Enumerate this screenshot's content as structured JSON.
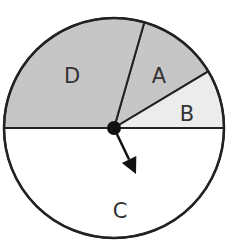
{
  "diagram": {
    "type": "spinner",
    "center": [
      114,
      128
    ],
    "radius": 110,
    "sections": [
      {
        "label": "A",
        "start_deg": 31,
        "end_deg": 74,
        "fill": "#c6c6c6",
        "label_pos": [
          159,
          83
        ]
      },
      {
        "label": "B",
        "start_deg": 0,
        "end_deg": 31,
        "fill": "#ececec",
        "label_pos": [
          187,
          121
        ]
      },
      {
        "label": "C",
        "start_deg": 180,
        "end_deg": 360,
        "fill": "#ffffff",
        "label_pos": [
          120,
          218
        ]
      },
      {
        "label": "D",
        "start_deg": 74,
        "end_deg": 180,
        "fill": "#c6c6c6",
        "label_pos": [
          72,
          83
        ]
      }
    ],
    "arrow": {
      "from": [
        114,
        128
      ],
      "to": [
        136,
        174
      ],
      "color": "#111111"
    },
    "outline_color": "#222222"
  },
  "chart_data": {
    "type": "pie",
    "categories": [
      "A",
      "B",
      "C",
      "D"
    ],
    "values": [
      12,
      8.5,
      50,
      29.5
    ],
    "title": "",
    "annotations": [
      "spinner arrow pointing into section C"
    ]
  }
}
